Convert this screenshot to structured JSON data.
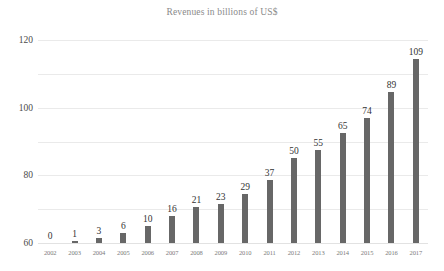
{
  "chart_data": {
    "type": "bar",
    "title": "Revenues in billions of US$",
    "xlabel": "",
    "ylabel": "",
    "categories": [
      "2002",
      "2003",
      "2004",
      "2005",
      "2006",
      "2007",
      "2008",
      "2009",
      "2010",
      "2011",
      "2012",
      "2013",
      "2014",
      "2015",
      "2016",
      "2017"
    ],
    "values": [
      0,
      1,
      3,
      6,
      10,
      16,
      21,
      23,
      29,
      37,
      50,
      55,
      65,
      74,
      89,
      109
    ],
    "data_labels": [
      "0",
      "1",
      "3",
      "6",
      "10",
      "16",
      "21",
      "23",
      "29",
      "37",
      "50",
      "55",
      "65",
      "74",
      "89",
      "109"
    ],
    "ylim": [
      0,
      120
    ],
    "yticks": [
      0,
      20,
      40,
      60,
      80,
      100,
      120
    ],
    "ytick_labels": [
      "0",
      "20",
      "40",
      "60",
      "80",
      "100",
      "120"
    ],
    "grid": "horizontal",
    "legend": "none",
    "bar_color": "#676767",
    "gridline_color": "#eaeaea",
    "title_color": "#8a8a8a",
    "label_color": "#333333",
    "tick_color": "#7b7b7b",
    "background_color": "#ffffff"
  }
}
